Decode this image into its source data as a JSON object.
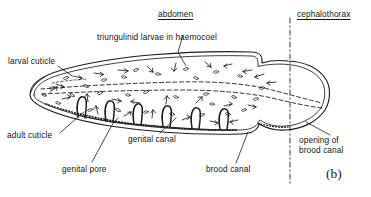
{
  "figure": {
    "panel_label": "(b)",
    "caption_region_labels": {
      "abdomen": "abdomen",
      "cephalothorax": "cephalothorax"
    },
    "annotations": [
      {
        "id": "abdomen",
        "text": "abdomen",
        "underlined": true
      },
      {
        "id": "cephalothorax",
        "text": "cephalothorax",
        "underlined": true
      },
      {
        "id": "triungulinid",
        "text": "triungulinid larvae in haemocoel",
        "underlined": false
      },
      {
        "id": "larval-cuticle",
        "text": "larval cuticle",
        "underlined": false
      },
      {
        "id": "adult-cuticle",
        "text": "adult cuticle",
        "underlined": false
      },
      {
        "id": "genital-canal",
        "text": "genital canal",
        "underlined": false
      },
      {
        "id": "genital-pore",
        "text": "genital pore",
        "underlined": false
      },
      {
        "id": "brood-canal",
        "text": "brood canal",
        "underlined": false
      },
      {
        "id": "opening-line1",
        "text": "opening of",
        "underlined": false
      },
      {
        "id": "opening-line2",
        "text": "brood canal",
        "underlined": false
      }
    ],
    "colors": {
      "background": "#ffffff",
      "ink": "#1a1a1a",
      "line": "#222222"
    }
  }
}
